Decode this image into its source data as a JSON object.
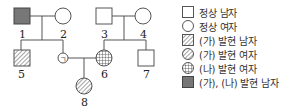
{
  "pedigree": {
    "individuals": [
      {
        "id": "1",
        "label": "1",
        "sex": "male",
        "phenotype": "(가), (나) 발현 남자"
      },
      {
        "id": "2",
        "label": "2",
        "sex": "female",
        "phenotype": "정상 여자"
      },
      {
        "id": "3",
        "label": "3",
        "sex": "male",
        "phenotype": "정상 남자"
      },
      {
        "id": "4",
        "label": "4",
        "sex": "female",
        "phenotype": "정상 여자"
      },
      {
        "id": "5",
        "label": "5",
        "sex": "male",
        "phenotype": "(가) 발현 남자"
      },
      {
        "id": "g",
        "label": "ㄱ",
        "sex": "female",
        "phenotype": "unknown"
      },
      {
        "id": "6",
        "label": "6",
        "sex": "female",
        "phenotype": "(나) 발현 여자"
      },
      {
        "id": "7",
        "label": "7",
        "sex": "male",
        "phenotype": "정상 남자"
      },
      {
        "id": "8",
        "label": "8",
        "sex": "female",
        "phenotype": "(가) 발현 여자"
      }
    ]
  },
  "legend": {
    "items": [
      {
        "icon": "square-empty-icon",
        "label": "정상 남자"
      },
      {
        "icon": "circle-empty-icon",
        "label": "정상 여자"
      },
      {
        "icon": "square-hatched-icon",
        "label": "(가) 발현 남자"
      },
      {
        "icon": "circle-hatched-icon",
        "label": "(가) 발현 여자"
      },
      {
        "icon": "circle-grid-icon",
        "label": "(나) 발현 여자"
      },
      {
        "icon": "square-filled-icon",
        "label": "(가), (나) 발현 남자"
      }
    ]
  },
  "colors": {
    "line": "#555555",
    "filled": "#777777",
    "hatch": "#666666"
  }
}
